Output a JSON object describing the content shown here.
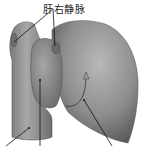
{
  "figure": {
    "labels": [
      {
        "text": "肝右静脉",
        "x": 43,
        "y": 1
      }
    ],
    "colors": {
      "background": "#ffffff",
      "organ_fill": "#8c8c8c",
      "organ_light": "#b4b4b4",
      "organ_dark": "#5e5e5e",
      "ivc_fill": "#8a8a8a",
      "leader_line": "#111111"
    }
  }
}
